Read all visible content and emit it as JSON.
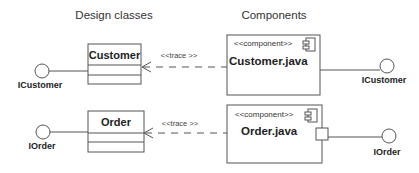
{
  "headers": {
    "design": "Design classes",
    "components": "Components"
  },
  "classes": [
    {
      "name": "Customer",
      "interface": "ICustomer"
    },
    {
      "name": "Order",
      "interface": "IOrder"
    }
  ],
  "components": [
    {
      "stereotype": "<<component>>",
      "name": "Customer.java",
      "interface": "ICustomer"
    },
    {
      "stereotype": "<<component>>",
      "name": "Order.java",
      "interface": "IOrder"
    }
  ],
  "relations": [
    {
      "label": "<<trace >>"
    },
    {
      "label": "<<trace >>"
    }
  ],
  "colors": {
    "line": "#555555",
    "text": "#222222"
  }
}
